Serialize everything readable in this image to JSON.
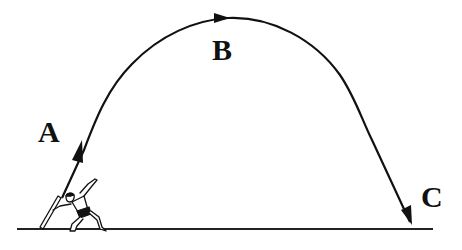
{
  "diagram": {
    "labels": {
      "a": "A",
      "b": "B",
      "c": "C"
    },
    "colors": {
      "stroke": "#111111",
      "background": "#ffffff"
    },
    "elements": {
      "ground": "ground-line",
      "athlete": "javelin-thrower-figure",
      "trajectory": "javelin-flight-path"
    }
  }
}
